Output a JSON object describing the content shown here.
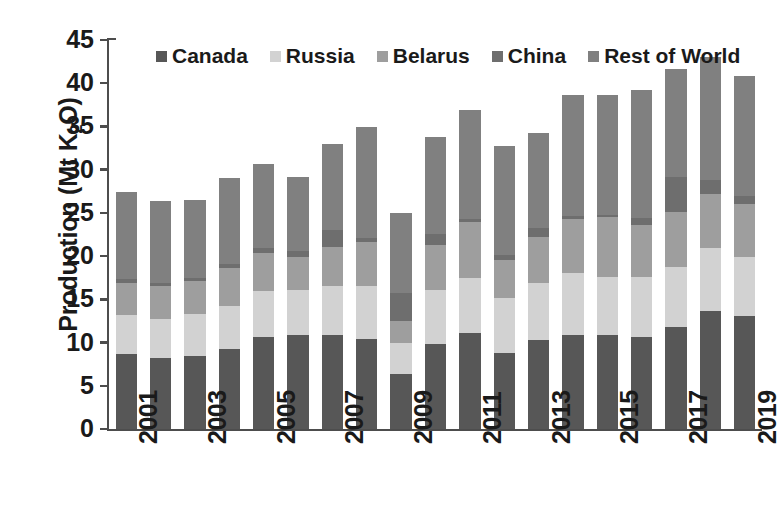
{
  "chart_data": {
    "type": "bar",
    "subtype": "stacked",
    "title": "",
    "xlabel": "",
    "ylabel": "Production (Mt K2O)",
    "ylabel_parts": {
      "prefix": "Production (Mt K",
      "sub": "2",
      "suffix": "O)"
    },
    "ylim": [
      0,
      45
    ],
    "yticks": [
      0,
      5,
      10,
      15,
      20,
      25,
      30,
      35,
      40,
      45
    ],
    "ytick_labels": [
      "0",
      "5",
      "10",
      "15",
      "20",
      "25",
      "30",
      "35",
      "40",
      "45"
    ],
    "grid": false,
    "legend_position": "top-center-inside",
    "categories": [
      "2001",
      "2002",
      "2003",
      "2004",
      "2005",
      "2006",
      "2007",
      "2008",
      "2009",
      "2010",
      "2011",
      "2012",
      "2013",
      "2014",
      "2015",
      "2016",
      "2017",
      "2018",
      "2019"
    ],
    "xtick_labels_shown": [
      "2001",
      "2003",
      "2005",
      "2007",
      "2009",
      "2011",
      "2013",
      "2015",
      "2017",
      "2019"
    ],
    "series": [
      {
        "name": "Canada",
        "color": "#575757",
        "values": [
          8.7,
          8.2,
          8.5,
          9.2,
          10.6,
          10.9,
          10.9,
          10.4,
          6.4,
          9.8,
          11.1,
          8.8,
          10.3,
          10.9,
          10.9,
          10.6,
          11.8,
          13.6,
          13.1
        ]
      },
      {
        "name": "Russia",
        "color": "#d2d2d2",
        "values": [
          4.5,
          4.5,
          4.8,
          5.0,
          5.4,
          5.2,
          5.6,
          6.2,
          3.6,
          6.3,
          6.4,
          6.3,
          6.6,
          7.2,
          6.7,
          7.0,
          6.9,
          7.3,
          6.8
        ]
      },
      {
        "name": "Belarus",
        "color": "#9e9e9e",
        "values": [
          3.7,
          3.8,
          3.8,
          4.4,
          4.4,
          3.8,
          4.6,
          5.0,
          2.5,
          5.2,
          6.5,
          4.5,
          5.3,
          6.2,
          6.9,
          6.0,
          6.4,
          6.3,
          6.1
        ]
      },
      {
        "name": "China",
        "color": "#6e6e6e",
        "values": [
          0.4,
          0.4,
          0.4,
          0.5,
          0.6,
          0.7,
          1.9,
          0.5,
          3.2,
          1.3,
          0.3,
          0.5,
          1.1,
          0.3,
          0.3,
          0.8,
          4.0,
          1.6,
          1.0
        ]
      },
      {
        "name": "Rest of World",
        "color": "#808080",
        "values": [
          10.1,
          9.5,
          9.0,
          9.9,
          9.7,
          8.5,
          10.0,
          12.8,
          9.3,
          11.2,
          12.6,
          12.6,
          10.9,
          14.1,
          13.9,
          14.8,
          12.5,
          14.2,
          13.8
        ]
      }
    ],
    "totals": [
      27.4,
      26.4,
      26.5,
      29.0,
      30.7,
      29.1,
      33.0,
      34.9,
      25.0,
      33.8,
      36.9,
      32.7,
      34.2,
      38.7,
      38.7,
      39.2,
      41.6,
      43.0,
      40.8
    ]
  }
}
